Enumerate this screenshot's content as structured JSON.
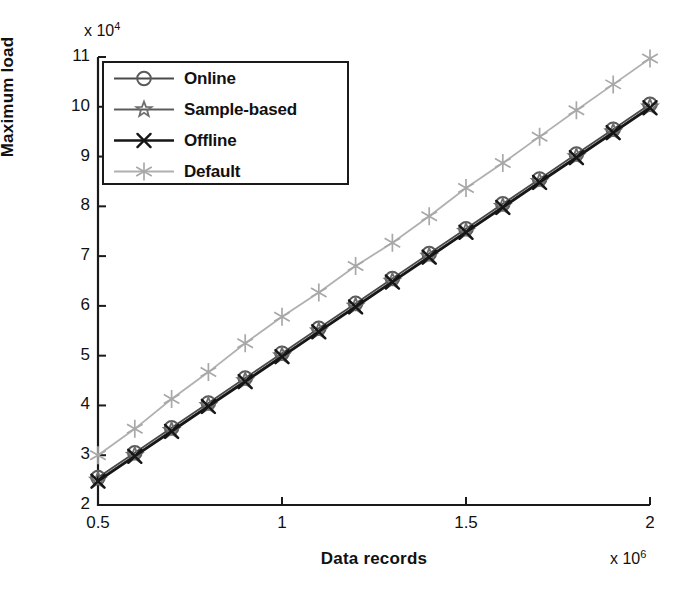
{
  "chart_data": {
    "type": "line",
    "title": "",
    "xlabel": "Data records",
    "ylabel": "Maximum load",
    "x_exponent_text": "x 10",
    "x_exponent_power": "6",
    "y_exponent_text": "x 10",
    "y_exponent_power": "4",
    "xlim": [
      0.5,
      2.0
    ],
    "ylim": [
      2,
      11
    ],
    "xticks": [
      0.5,
      1,
      1.5,
      2
    ],
    "xtick_labels": [
      "0.5",
      "1",
      "1.5",
      "2"
    ],
    "yticks": [
      2,
      3,
      4,
      5,
      6,
      7,
      8,
      9,
      10,
      11
    ],
    "ytick_labels": [
      "2",
      "3",
      "4",
      "5",
      "6",
      "7",
      "8",
      "9",
      "10",
      "11"
    ],
    "grid": false,
    "legend_position": "upper-left",
    "x": [
      0.5,
      0.6,
      0.7,
      0.8,
      0.9,
      1.0,
      1.1,
      1.2,
      1.3,
      1.4,
      1.5,
      1.6,
      1.7,
      1.8,
      1.9,
      2.0
    ],
    "series": [
      {
        "name": "Online",
        "marker": "circle",
        "color": "#5a5a5a",
        "line_color": "#4a4a4a",
        "values": [
          2.55,
          3.05,
          3.55,
          4.05,
          4.55,
          5.05,
          5.55,
          6.05,
          6.55,
          7.05,
          7.55,
          8.05,
          8.55,
          9.05,
          9.55,
          10.05
        ]
      },
      {
        "name": "Sample-based",
        "marker": "star",
        "color": "#6e6e6e",
        "line_color": "#5c5c5c",
        "values": [
          2.5,
          3.0,
          3.5,
          4.0,
          4.5,
          5.0,
          5.5,
          6.0,
          6.5,
          7.0,
          7.5,
          8.0,
          8.5,
          9.0,
          9.5,
          10.0
        ]
      },
      {
        "name": "Offline",
        "marker": "cross",
        "color": "#161616",
        "line_color": "#161616",
        "values": [
          2.48,
          2.98,
          3.48,
          3.98,
          4.48,
          4.98,
          5.48,
          5.98,
          6.48,
          6.98,
          7.48,
          7.98,
          8.48,
          8.98,
          9.48,
          9.98
        ]
      },
      {
        "name": "Default",
        "marker": "asterisk",
        "color": "#a8a8a8",
        "line_color": "#b0b0b0",
        "values": [
          3.0,
          3.53,
          4.13,
          4.67,
          5.25,
          5.78,
          6.27,
          6.8,
          7.27,
          7.8,
          8.37,
          8.87,
          9.4,
          9.93,
          10.45,
          10.97
        ]
      }
    ]
  }
}
